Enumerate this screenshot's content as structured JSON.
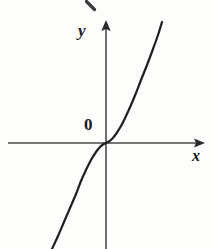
{
  "figure": {
    "background_color": "#fdfdfc",
    "ink_color": "#231f20",
    "axis_color": "#4a4a4a",
    "width": 212,
    "height": 249
  },
  "labels": {
    "y_axis": "y",
    "x_axis": "x",
    "origin": "0"
  },
  "artifacts": {
    "top_clipped_stroke": ""
  },
  "chart_data": {
    "type": "line",
    "title": "",
    "subtitle": "",
    "xlabel": "x",
    "ylabel": "y",
    "origin_label": "0",
    "grid": false,
    "legend": null,
    "annotations": [
      "0"
    ],
    "axis_style": {
      "x_axis_arrow": "right",
      "y_axis_arrow": "up",
      "x_axis_pixel_y": 143,
      "y_axis_pixel_x": 106,
      "x_axis_from_px": 8,
      "x_axis_to_px": 205,
      "y_axis_from_px": 249,
      "y_axis_to_px": 20
    },
    "function": "y = x^3",
    "xlim": [
      -2.1,
      1.9
    ],
    "ylim": [
      -6.0,
      6.0
    ],
    "x": [
      -1.85,
      -1.7,
      -1.55,
      -1.4,
      -1.25,
      -1.1,
      -0.95,
      -0.8,
      -0.65,
      -0.5,
      -0.35,
      -0.2,
      0,
      0.2,
      0.35,
      0.5,
      0.65,
      0.8,
      0.95,
      1.1,
      1.25,
      1.4,
      1.55,
      1.7
    ],
    "y": [
      -6.33,
      -4.91,
      -3.72,
      -2.74,
      -1.95,
      -1.33,
      -0.86,
      -0.51,
      -0.27,
      -0.13,
      -0.04,
      -0.01,
      0,
      0.01,
      0.04,
      0.13,
      0.27,
      0.51,
      0.86,
      1.33,
      1.95,
      2.74,
      3.72,
      4.91
    ],
    "series": [
      {
        "name": "y = x^3",
        "color": "#231f20",
        "line_width": 2.2,
        "points_px": [
          [
            52,
            249
          ],
          [
            58,
            236
          ],
          [
            64,
            222
          ],
          [
            70,
            208
          ],
          [
            76,
            194
          ],
          [
            81,
            181
          ],
          [
            86,
            170
          ],
          [
            91,
            160
          ],
          [
            96,
            152
          ],
          [
            100,
            147
          ],
          [
            103,
            144.5
          ],
          [
            106,
            143
          ],
          [
            109,
            141.5
          ],
          [
            112,
            139
          ],
          [
            116,
            134
          ],
          [
            121,
            126
          ],
          [
            126,
            116
          ],
          [
            131,
            105
          ],
          [
            136,
            93
          ],
          [
            141,
            80
          ],
          [
            147,
            65
          ],
          [
            153,
            49
          ],
          [
            158,
            35
          ],
          [
            162,
            22
          ]
        ]
      }
    ]
  }
}
